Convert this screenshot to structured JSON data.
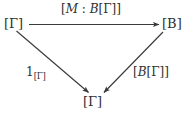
{
  "diagram": {
    "kind": "commutative-triangle",
    "background_color": "#ffffff",
    "ink_color": "#303030",
    "nodes": [
      {
        "id": "top-left",
        "text": "[Γ]",
        "role": "source-object"
      },
      {
        "id": "top-right",
        "text": "[B]",
        "role": "target-object"
      },
      {
        "id": "bottom",
        "text": "[Γ]",
        "role": "apex-object"
      }
    ],
    "edges": [
      {
        "id": "top",
        "from": "top-left",
        "to": "top-right",
        "direction": "right",
        "label_parts": {
          "open": "[",
          "mvar": "M",
          "colon": " : ",
          "bvar": "B",
          "inner": "[Γ]",
          "close": "]"
        },
        "label_plain": "[M : B[Γ]]"
      },
      {
        "id": "left-diagonal",
        "from": "top-left",
        "to": "bottom",
        "direction": "down-right",
        "label_parts": {
          "base": "1",
          "subscript": "[Γ]"
        },
        "label_plain": "1[Γ]"
      },
      {
        "id": "right-diagonal",
        "from": "top-right",
        "to": "bottom",
        "direction": "down-left",
        "label_parts": {
          "open": "[",
          "bvar": "B",
          "inner": "[Γ]",
          "close": "]"
        },
        "label_plain": "[B[Γ]]"
      }
    ]
  }
}
